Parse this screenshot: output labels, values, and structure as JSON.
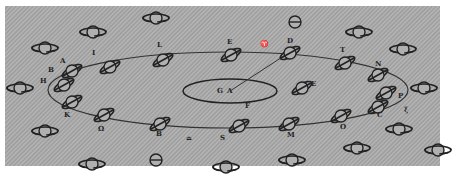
{
  "figure": {
    "colors": {
      "background": "#a8a8a8",
      "ink": "#222222"
    },
    "center": {
      "labels": [
        "G",
        "A"
      ],
      "point_label": "F"
    },
    "orbit_labels": {
      "top": [
        "I",
        "L",
        "E",
        "D",
        "T",
        "N"
      ],
      "left": [
        "A",
        "B",
        "H",
        "K"
      ],
      "bottom": [
        "Ω",
        "B",
        "S",
        "M",
        "O",
        "C"
      ],
      "right": [
        "P",
        "E"
      ],
      "symbols": {
        "aries": "♈",
        "libra_like": "♎",
        "xi": "ξ"
      }
    }
  }
}
